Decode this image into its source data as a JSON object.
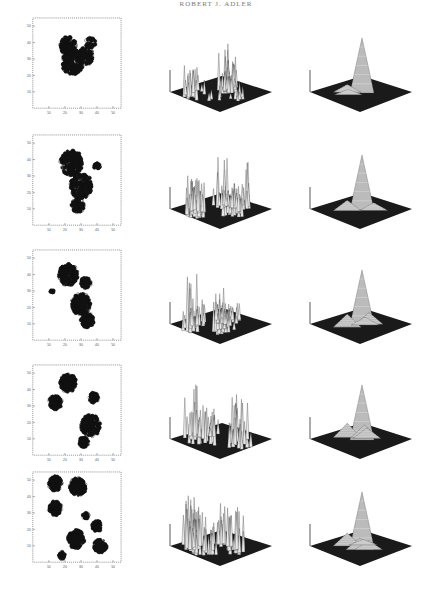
{
  "page": {
    "running_head": "ROBERT J. ADLER"
  },
  "figure": {
    "layout": "5 rows x 3 columns: contour map, raw 3D surface, smoothed 3D surface",
    "axis_ticks": {
      "x": [
        "10",
        "20",
        "30",
        "40",
        "50"
      ],
      "y": [
        "10",
        "20",
        "30",
        "40",
        "50"
      ]
    },
    "colors": {
      "ink": "#111111",
      "surface_base": "#1a1a1a",
      "surface_line": "#e8e8e8",
      "frame": "#444444"
    }
  },
  "chart_data": [
    {
      "type": "heatmap",
      "row": 1,
      "panel": "contour",
      "xlim": [
        0,
        55
      ],
      "ylim": [
        0,
        55
      ],
      "xticks": [
        "10",
        "20",
        "30",
        "40",
        "50"
      ],
      "yticks": [
        "10",
        "20",
        "30",
        "40",
        "50"
      ],
      "clusters": [
        {
          "x": 25,
          "y": 28,
          "spread": 7,
          "weight": 1.0
        },
        {
          "x": 22,
          "y": 38,
          "spread": 5,
          "weight": 0.8
        },
        {
          "x": 33,
          "y": 32,
          "spread": 5,
          "weight": 0.6
        },
        {
          "x": 36,
          "y": 40,
          "spread": 3,
          "weight": 0.4
        }
      ]
    },
    {
      "type": "area",
      "row": 1,
      "panel": "raw-surface",
      "peaks": [
        0.55,
        0.95,
        0.7,
        0.45,
        0.4,
        0.3,
        0.25,
        0.35,
        0.2
      ],
      "spread": "narrow cluster"
    },
    {
      "type": "area",
      "row": 1,
      "panel": "smoothed-surface",
      "peaks": [
        1.0,
        0.3,
        0.2
      ],
      "spread": "single sharp peak"
    },
    {
      "type": "heatmap",
      "row": 2,
      "panel": "contour",
      "xlim": [
        0,
        55
      ],
      "ylim": [
        0,
        55
      ],
      "xticks": [
        "10",
        "20",
        "30",
        "40",
        "50"
      ],
      "yticks": [
        "10",
        "20",
        "30",
        "40",
        "50"
      ],
      "clusters": [
        {
          "x": 24,
          "y": 38,
          "spread": 7,
          "weight": 1.0
        },
        {
          "x": 30,
          "y": 24,
          "spread": 7,
          "weight": 1.0
        },
        {
          "x": 28,
          "y": 12,
          "spread": 4,
          "weight": 0.6
        },
        {
          "x": 40,
          "y": 36,
          "spread": 2,
          "weight": 0.3
        }
      ]
    },
    {
      "type": "area",
      "row": 2,
      "panel": "raw-surface",
      "peaks": [
        0.8,
        0.9,
        0.75,
        0.6,
        0.85,
        0.55,
        0.5,
        0.45,
        0.6,
        0.4
      ],
      "spread": "wide cluster"
    },
    {
      "type": "area",
      "row": 2,
      "panel": "smoothed-surface",
      "peaks": [
        1.0,
        0.4,
        0.3
      ],
      "spread": "single peak, broader base"
    },
    {
      "type": "heatmap",
      "row": 3,
      "panel": "contour",
      "xlim": [
        0,
        55
      ],
      "ylim": [
        0,
        55
      ],
      "xticks": [
        "10",
        "20",
        "30",
        "40",
        "50"
      ],
      "yticks": [
        "10",
        "20",
        "30",
        "40",
        "50"
      ],
      "clusters": [
        {
          "x": 22,
          "y": 40,
          "spread": 6,
          "weight": 1.0
        },
        {
          "x": 33,
          "y": 35,
          "spread": 3,
          "weight": 0.6
        },
        {
          "x": 30,
          "y": 22,
          "spread": 6,
          "weight": 0.9
        },
        {
          "x": 34,
          "y": 12,
          "spread": 4,
          "weight": 0.7
        },
        {
          "x": 12,
          "y": 30,
          "spread": 1,
          "weight": 0.3
        }
      ]
    },
    {
      "type": "area",
      "row": 3,
      "panel": "raw-surface",
      "peaks": [
        1.0,
        0.6,
        0.7,
        0.45,
        0.35,
        0.4,
        0.3,
        0.35,
        0.3,
        0.25
      ],
      "spread": "two clusters"
    },
    {
      "type": "area",
      "row": 3,
      "panel": "smoothed-surface",
      "peaks": [
        1.0,
        0.5,
        0.45,
        0.3
      ],
      "spread": "main peak with shoulders"
    },
    {
      "type": "heatmap",
      "row": 4,
      "panel": "contour",
      "xlim": [
        0,
        55
      ],
      "ylim": [
        0,
        55
      ],
      "xticks": [
        "10",
        "20",
        "30",
        "40",
        "50"
      ],
      "yticks": [
        "10",
        "20",
        "30",
        "40",
        "50"
      ],
      "clusters": [
        {
          "x": 22,
          "y": 44,
          "spread": 5,
          "weight": 1.0
        },
        {
          "x": 14,
          "y": 32,
          "spread": 4,
          "weight": 0.8
        },
        {
          "x": 38,
          "y": 35,
          "spread": 3,
          "weight": 0.5
        },
        {
          "x": 36,
          "y": 18,
          "spread": 6,
          "weight": 1.0
        },
        {
          "x": 32,
          "y": 8,
          "spread": 3,
          "weight": 0.7
        }
      ]
    },
    {
      "type": "area",
      "row": 4,
      "panel": "raw-surface",
      "peaks": [
        1.0,
        0.7,
        0.5,
        0.35,
        0.3,
        0.8,
        0.75,
        0.6,
        0.5
      ],
      "spread": "two separated clusters"
    },
    {
      "type": "area",
      "row": 4,
      "panel": "smoothed-surface",
      "peaks": [
        1.0,
        0.55,
        0.5,
        0.4
      ],
      "spread": "central peak with side lobes"
    },
    {
      "type": "heatmap",
      "row": 5,
      "panel": "contour",
      "xlim": [
        0,
        55
      ],
      "ylim": [
        0,
        55
      ],
      "xticks": [
        "10",
        "20",
        "30",
        "40",
        "50"
      ],
      "yticks": [
        "10",
        "20",
        "30",
        "40",
        "50"
      ],
      "clusters": [
        {
          "x": 14,
          "y": 48,
          "spread": 4,
          "weight": 0.9
        },
        {
          "x": 28,
          "y": 46,
          "spread": 5,
          "weight": 1.0
        },
        {
          "x": 14,
          "y": 33,
          "spread": 4,
          "weight": 0.8
        },
        {
          "x": 27,
          "y": 14,
          "spread": 5,
          "weight": 1.0
        },
        {
          "x": 40,
          "y": 22,
          "spread": 3,
          "weight": 0.6
        },
        {
          "x": 42,
          "y": 10,
          "spread": 4,
          "weight": 0.8
        },
        {
          "x": 18,
          "y": 4,
          "spread": 2,
          "weight": 0.5
        },
        {
          "x": 33,
          "y": 28,
          "spread": 2,
          "weight": 0.4
        }
      ]
    },
    {
      "type": "area",
      "row": 5,
      "panel": "raw-surface",
      "peaks": [
        0.9,
        1.0,
        0.85,
        0.6,
        0.4,
        0.7,
        0.8,
        0.75,
        0.6,
        0.55
      ],
      "spread": "many scattered clusters"
    },
    {
      "type": "area",
      "row": 5,
      "panel": "smoothed-surface",
      "peaks": [
        1.0,
        0.5,
        0.45,
        0.35,
        0.2
      ],
      "spread": "central peak with broad shoulders"
    }
  ]
}
